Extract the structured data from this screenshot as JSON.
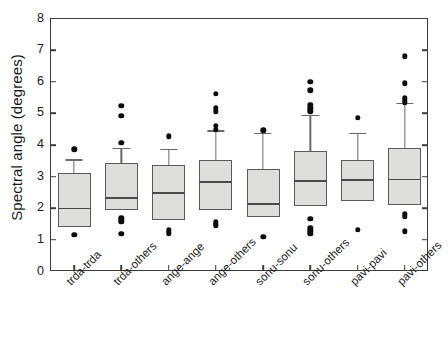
{
  "chart_data": {
    "type": "box",
    "title": "",
    "xlabel": "",
    "ylabel": "Spectral angle (degrees)",
    "ylim": [
      0,
      8
    ],
    "yticks": [
      0,
      1,
      2,
      3,
      4,
      5,
      6,
      7,
      8
    ],
    "ytick_labels": [
      "0",
      "1",
      "2",
      "3",
      "4",
      "5",
      "6",
      "7",
      "8"
    ],
    "grid": false,
    "legend": null,
    "categories": [
      "trda-trda",
      "trda-others",
      "ange-ange",
      "ange-others",
      "sonu-sonu",
      "sonu-others",
      "pavi-pavi",
      "pavi-others"
    ],
    "boxes": [
      {
        "category": "trda-trda",
        "whisker_low": 1.42,
        "q1": 1.42,
        "median": 2.01,
        "q3": 3.12,
        "whisker_high": 3.55,
        "outliers": [
          3.86,
          1.16
        ]
      },
      {
        "category": "trda-others",
        "whisker_low": 1.93,
        "q1": 1.93,
        "median": 2.35,
        "q3": 3.44,
        "whisker_high": 3.92,
        "outliers": [
          5.23,
          4.93,
          4.07,
          1.69,
          1.63,
          1.58,
          1.2
        ]
      },
      {
        "category": "ange-ange",
        "whisker_low": 1.63,
        "q1": 1.63,
        "median": 2.5,
        "q3": 3.38,
        "whisker_high": 3.88,
        "outliers": [
          4.27,
          1.3,
          1.21
        ]
      },
      {
        "category": "ange-others",
        "whisker_low": 1.95,
        "q1": 1.95,
        "median": 2.86,
        "q3": 3.51,
        "whisker_high": 4.47,
        "outliers": [
          5.61,
          5.17,
          5.06,
          4.6,
          4.49,
          1.58,
          1.5,
          1.46
        ]
      },
      {
        "category": "sonu-sonu",
        "whisker_low": 1.71,
        "q1": 1.71,
        "median": 2.16,
        "q3": 3.23,
        "whisker_high": 4.38,
        "outliers": [
          4.46,
          1.1
        ]
      },
      {
        "category": "sonu-others",
        "whisker_low": 2.07,
        "q1": 2.07,
        "median": 2.89,
        "q3": 3.8,
        "whisker_high": 4.95,
        "outliers": [
          6.0,
          5.73,
          5.28,
          5.16,
          5.07,
          1.66,
          1.36,
          1.27,
          1.2
        ]
      },
      {
        "category": "pavi-pavi",
        "whisker_low": 2.24,
        "q1": 2.24,
        "median": 2.91,
        "q3": 3.54,
        "whisker_high": 4.39,
        "outliers": [
          4.86,
          1.32
        ]
      },
      {
        "category": "pavi-others",
        "whisker_low": 2.09,
        "q1": 2.09,
        "median": 2.93,
        "q3": 3.92,
        "whisker_high": 5.33,
        "outliers": [
          6.81,
          5.95,
          5.48,
          5.39,
          5.33,
          1.81,
          1.73,
          1.27
        ]
      }
    ]
  },
  "colors": {
    "box_fill": "#dededc",
    "box_edge": "#5a5a5a",
    "axis": "#3c3c3c",
    "outlier": "#0d0d0d",
    "text": "#1a1a1a",
    "background": "#ffffff"
  }
}
